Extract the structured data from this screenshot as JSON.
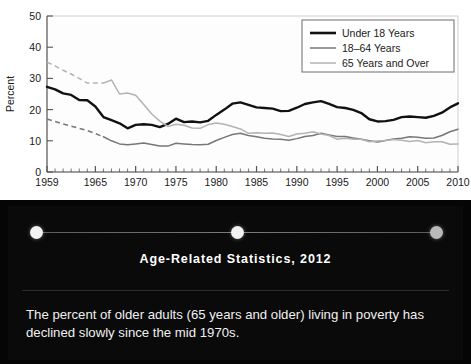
{
  "slide": {
    "title": "Age-Related Statistics, 2012",
    "body": "The percent of older adults (65 years and older) living in poverty has declined slowly since the mid 1970s.",
    "stepper": {
      "dots": [
        {
          "name": "step-dot-1",
          "state": "active"
        },
        {
          "name": "step-dot-2",
          "state": "active"
        },
        {
          "name": "step-dot-3",
          "state": "dim"
        }
      ]
    },
    "colors": {
      "background": "#050505",
      "title_color": "#ffffff",
      "body_color": "#f0f0f0",
      "dot_active": "#f2f2f2",
      "dot_dim": "#b9b9b9"
    }
  },
  "chart_data": {
    "type": "line",
    "title": "",
    "xlabel": "",
    "ylabel": "Percent",
    "xlim": [
      1959,
      2010
    ],
    "ylim": [
      0,
      50
    ],
    "yticks": [
      0,
      10,
      20,
      30,
      40,
      50
    ],
    "ytick_labels": [
      "0",
      "10",
      "20",
      "30",
      "40",
      "50"
    ],
    "xticks": [
      1959,
      1965,
      1970,
      1975,
      1980,
      1985,
      1990,
      1995,
      2000,
      2005,
      2010
    ],
    "xtick_labels": [
      "1959",
      "1965",
      "1970",
      "1975",
      "1980",
      "1985",
      "1990",
      "1995",
      "2000",
      "2005",
      "2010"
    ],
    "minor_xtick_interval": 1,
    "grid": false,
    "legend_position": "top-right",
    "legend_border": true,
    "colors": {
      "under18": "#111111",
      "age18to64": "#777777",
      "age65plus": "#b3b3b3",
      "axis": "#555555",
      "plot_border": "#cfcfcf"
    },
    "x": [
      1959,
      1960,
      1961,
      1962,
      1963,
      1964,
      1965,
      1966,
      1967,
      1968,
      1969,
      1970,
      1971,
      1972,
      1973,
      1974,
      1975,
      1976,
      1977,
      1978,
      1979,
      1980,
      1981,
      1982,
      1983,
      1984,
      1985,
      1986,
      1987,
      1988,
      1989,
      1990,
      1991,
      1992,
      1993,
      1994,
      1995,
      1996,
      1997,
      1998,
      1999,
      2000,
      2001,
      2002,
      2003,
      2004,
      2005,
      2006,
      2007,
      2008,
      2009,
      2010
    ],
    "series": [
      {
        "name": "Under 18 Years",
        "key": "under18",
        "style": "solid",
        "width": 2.4,
        "values": [
          27.3,
          26.5,
          25.2,
          24.7,
          23.1,
          23.0,
          21.0,
          17.6,
          16.6,
          15.6,
          14.0,
          15.1,
          15.3,
          15.1,
          14.4,
          15.4,
          17.1,
          16.0,
          16.2,
          15.9,
          16.4,
          18.3,
          20.0,
          21.9,
          22.3,
          21.5,
          20.7,
          20.5,
          20.3,
          19.5,
          19.6,
          20.6,
          21.8,
          22.3,
          22.7,
          21.8,
          20.8,
          20.5,
          19.9,
          18.9,
          16.9,
          16.2,
          16.3,
          16.7,
          17.6,
          17.8,
          17.6,
          17.4,
          18.0,
          19.0,
          20.7,
          22.0
        ]
      },
      {
        "name": "18–64 Years",
        "key": "age18to64",
        "style": "dashed-then-solid",
        "solid_from": 1966,
        "width": 1.5,
        "values": [
          17.0,
          16.2,
          15.4,
          14.7,
          14.0,
          13.3,
          12.3,
          11.3,
          10.0,
          9.0,
          8.7,
          9.0,
          9.3,
          8.8,
          8.3,
          8.3,
          9.2,
          9.0,
          8.8,
          8.7,
          8.9,
          10.1,
          11.1,
          12.0,
          12.4,
          11.7,
          11.3,
          10.8,
          10.6,
          10.5,
          10.2,
          10.7,
          11.4,
          11.7,
          12.4,
          11.9,
          11.4,
          11.4,
          10.9,
          10.5,
          10.0,
          9.6,
          10.1,
          10.6,
          10.8,
          11.3,
          11.1,
          10.8,
          10.9,
          11.7,
          12.9,
          13.7
        ]
      },
      {
        "name": "65 Years and Over",
        "key": "age65plus",
        "style": "dashed-then-solid",
        "solid_from": 1966,
        "width": 1.5,
        "values": [
          35.2,
          34.0,
          32.6,
          31.4,
          30.0,
          28.5,
          28.5,
          28.5,
          29.5,
          25.0,
          25.3,
          24.6,
          21.6,
          18.6,
          16.3,
          14.6,
          15.3,
          15.0,
          14.1,
          14.0,
          15.2,
          15.7,
          15.3,
          14.6,
          13.8,
          12.4,
          12.6,
          12.4,
          12.5,
          12.0,
          11.4,
          12.2,
          12.4,
          12.9,
          12.2,
          11.7,
          10.5,
          10.8,
          10.5,
          10.5,
          9.7,
          9.9,
          10.1,
          10.4,
          10.2,
          9.8,
          10.1,
          9.4,
          9.7,
          9.7,
          8.9,
          9.0
        ]
      }
    ]
  }
}
